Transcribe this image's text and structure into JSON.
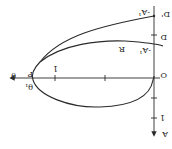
{
  "diagram": {
    "orientation": "rotated 180 degrees",
    "labels": {
      "theta": "θ",
      "p": "P",
      "theta1": "θ₁",
      "one_horizontal": "1",
      "origin": "O",
      "d": "D",
      "r": "R",
      "neg_a1_lower": "-A¹",
      "neg_a1_upper": "-A¹",
      "d_prime": "D'",
      "one_vertical": "1",
      "a": "A"
    },
    "colors": {
      "ink": "#2a2a2a",
      "background": "#ffffff"
    }
  }
}
